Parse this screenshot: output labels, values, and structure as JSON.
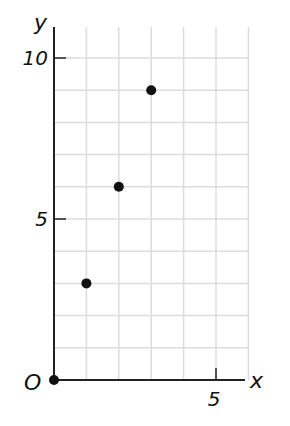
{
  "chart_data": {
    "type": "scatter",
    "title": "",
    "xlabel": "x",
    "ylabel": "y",
    "origin_label": "O",
    "x": [
      0,
      1,
      2,
      3
    ],
    "y": [
      0,
      3,
      6,
      9
    ],
    "points": [
      {
        "x": 0,
        "y": 0
      },
      {
        "x": 1,
        "y": 3
      },
      {
        "x": 2,
        "y": 6
      },
      {
        "x": 3,
        "y": 9
      }
    ],
    "xlim": [
      0,
      6
    ],
    "ylim": [
      0,
      10.9
    ],
    "x_ticks": [
      {
        "value": 5,
        "label": "5"
      }
    ],
    "y_ticks": [
      {
        "value": 5,
        "label": "5"
      },
      {
        "value": 10,
        "label": "10"
      }
    ],
    "grid": true,
    "grid_step": {
      "x": 1,
      "y": 1
    },
    "colors": {
      "grid": "#dcdcdc",
      "axis": "#222222",
      "point": "#111111"
    }
  }
}
